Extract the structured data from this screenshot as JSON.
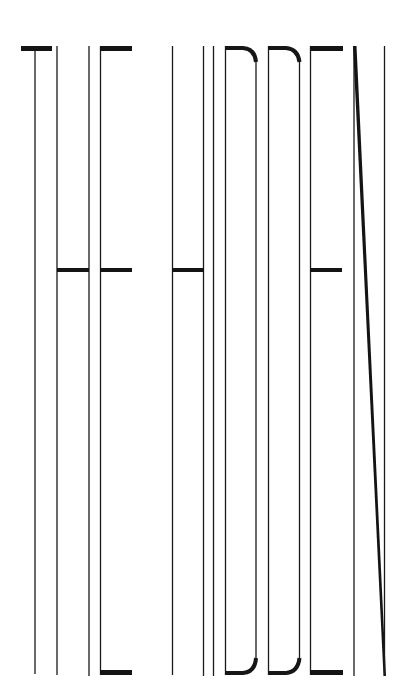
{
  "poster": {
    "title": "THE HIDDEN",
    "letters": [
      "T",
      "H",
      "E",
      "H",
      "I",
      "D",
      "D",
      "E",
      "N"
    ],
    "colors": {
      "background": "#ffffff",
      "ink": "#1a1a1a"
    }
  }
}
